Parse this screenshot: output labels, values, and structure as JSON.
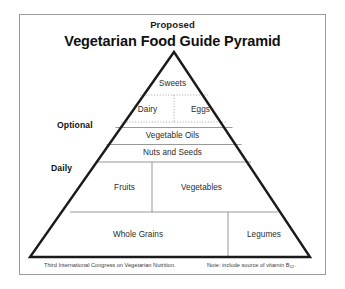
{
  "figure": {
    "title_sup": "Proposed",
    "title_main": "Vegetarian Food Guide Pyramid"
  },
  "side_labels": {
    "optional": "Optional",
    "daily": "Daily"
  },
  "tiers": {
    "sweets": "Sweets",
    "dairy": "Dairy",
    "eggs": "Eggs",
    "vegetable_oils": "Vegetable Oils",
    "nuts_and_seeds": "Nuts and Seeds",
    "fruits": "Fruits",
    "vegetables": "Vegetables",
    "whole_grains": "Whole Grains",
    "legumes": "Legumes"
  },
  "footnotes": {
    "left": "Third International Congress on Vegetarian Nutrition.",
    "right_prefix": "Note: include source of vitamin B",
    "right_sub": "12",
    "right_suffix": "."
  },
  "colors": {
    "frame_border": "#9a9a9a",
    "pyramid_outline": "#1a1a1a",
    "tier_line": "#8d8d8d",
    "dotted_line": "#a8a8a8",
    "background": "#ffffff",
    "text": "#2b2b2b"
  }
}
